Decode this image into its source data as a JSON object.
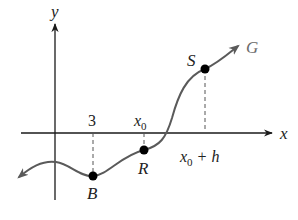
{
  "diagram": {
    "axes": {
      "x_label": "x",
      "y_label": "y"
    },
    "curve": {
      "name": "G",
      "color": "#5a5a5a"
    },
    "points": [
      {
        "label": "B",
        "x_tick": "3"
      },
      {
        "label": "R",
        "x_tick_base": "x",
        "x_tick_sub": "0"
      },
      {
        "label": "S",
        "x_tick_base": "x",
        "x_tick_sub": "0",
        "x_tick_suffix": " + h"
      }
    ],
    "colors": {
      "axis": "#1a1a1a",
      "curve": "#5a5a5a",
      "point": "#000000",
      "dashed": "#555555"
    }
  }
}
